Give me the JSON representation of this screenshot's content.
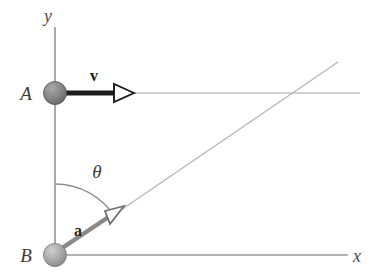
{
  "figure": {
    "kind": "physics-vector-diagram",
    "width": 377,
    "height": 275,
    "background_color": "#ffffff"
  },
  "axes": {
    "y_axis": {
      "label": "y",
      "label_x": 48,
      "label_y": 22,
      "x": 55,
      "y_top": 27,
      "y_bottom": 255,
      "color": "#9a9a9a",
      "stroke_width": 1.6
    },
    "x_axis": {
      "label": "x",
      "label_x": 352,
      "label_y": 262,
      "y": 255,
      "x_left": 55,
      "x_right": 348,
      "color": "#9a9a9a",
      "stroke_width": 1.6
    }
  },
  "points": [
    {
      "name": "A",
      "label": "A",
      "label_x": 24,
      "label_y": 100,
      "cx": 55,
      "cy": 93,
      "r": 11,
      "fill_light": "#a8a8a8",
      "fill_dark": "#6e6e6e",
      "edge_color": "#5a5a5a"
    },
    {
      "name": "B",
      "label": "B",
      "label_x": 24,
      "label_y": 262,
      "cx": 55,
      "cy": 255,
      "r": 11,
      "fill_light": "#c4c4c4",
      "fill_dark": "#8f8f8f",
      "edge_color": "#7d7d7d"
    }
  ],
  "vectors": [
    {
      "name": "v",
      "label": "v",
      "label_x": 88,
      "label_y": 80,
      "from_x": 64,
      "from_y": 93,
      "to_x": 133,
      "to_y": 93,
      "shaft_color": "#1c1c1c",
      "shaft_width": 5,
      "head_fill": "#ffffff",
      "head_stroke": "#1c1c1c",
      "head_length": 17,
      "head_halfwidth": 9
    },
    {
      "name": "a",
      "label": "a",
      "label_x": 72,
      "label_y": 234,
      "from_x": 62,
      "from_y": 248,
      "to_x": 122,
      "to_y": 208,
      "shaft_color": "#8a8a8a",
      "shaft_width": 4,
      "head_fill": "#ffffff",
      "head_stroke": "#707070",
      "head_length": 17,
      "head_halfwidth": 8
    }
  ],
  "guide_lines": [
    {
      "name": "horizontal-guide-through-A",
      "x1": 55,
      "y1": 93,
      "x2": 360,
      "y2": 93,
      "color": "#c2c2c2",
      "stroke_width": 1.3
    },
    {
      "name": "diagonal-trajectory-from-B",
      "x1": 55,
      "y1": 255,
      "x2": 338,
      "y2": 62,
      "color": "#b5b5b5",
      "stroke_width": 1.3
    }
  ],
  "angle": {
    "name": "theta",
    "label": "θ",
    "label_x": 89,
    "label_y": 178,
    "vertex_x": 55,
    "vertex_y": 255,
    "radius": 71,
    "start_x": 55,
    "start_y": 184,
    "end_x": 113,
    "end_y": 214,
    "arc_color": "#8d8d8d",
    "stroke_width": 1.3,
    "degrees_approx": 34
  }
}
